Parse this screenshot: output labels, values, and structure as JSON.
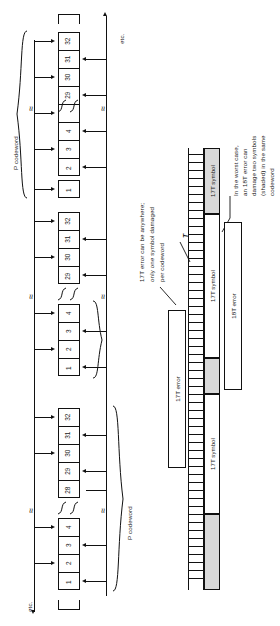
{
  "figure": {
    "etc_top": "etc.",
    "etc_bottom": "etc.",
    "codeword_label_1": "P codeword",
    "codeword_label_2": "P codeword",
    "break_mark": "≈"
  },
  "columns": [
    {
      "name": "column-1",
      "cells": [
        "32",
        "31",
        "30",
        "29",
        "",
        "4",
        "3",
        "2",
        "1"
      ]
    },
    {
      "name": "column-2",
      "cells": [
        "32",
        "31",
        "30",
        "29",
        "",
        "4",
        "3",
        "2",
        "1"
      ]
    },
    {
      "name": "column-3",
      "cells": [
        "32",
        "31",
        "30",
        "29",
        "28",
        "",
        "4",
        "3",
        "2",
        "1"
      ]
    }
  ],
  "annotations": {
    "note_17t": "17T error can be anywhere;\nonly one symbol damaged\nper codeword",
    "note_17t_lines": [
      "17T error can be anywhere;",
      "only one symbol damaged",
      "per codeword"
    ],
    "note_18t_lines": [
      "In the worst case,",
      "an 18T error can",
      "damage two symbols",
      "(shaded) in the same",
      "codeword"
    ],
    "t_marker": "T"
  },
  "bars": {
    "symbol_label": "17T symbol",
    "error_17t_label": "17T error",
    "error_18t_label": "18T error",
    "symbols": [
      {
        "label": "17T symbol",
        "shaded": false
      },
      {
        "label": "17T symbol",
        "shaded": true
      },
      {
        "label": "17T symbol",
        "shaded": false
      },
      {
        "label": "17T symbol",
        "shaded": true
      }
    ]
  },
  "colors": {
    "ink": "#111111",
    "paper": "#ffffff",
    "shade": "#d9d9d9"
  }
}
